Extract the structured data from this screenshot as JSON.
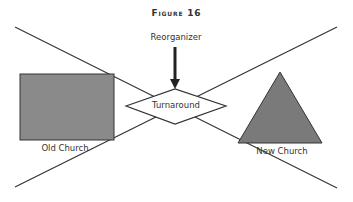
{
  "figure": {
    "title": "Figure 16"
  },
  "labels": {
    "reorganizer": "Reorganizer",
    "turnaround": "Turnaround",
    "old_church": "Old Church",
    "new_church": "New Church"
  },
  "colors": {
    "shape_fill": "#8a8a8a",
    "stroke": "#333333",
    "background": "#ffffff"
  },
  "geometry": {
    "line_a": {
      "x1": 15,
      "y1": 27,
      "x2": 337,
      "y2": 188
    },
    "line_b": {
      "x1": 15,
      "y1": 187,
      "x2": 337,
      "y2": 27
    },
    "rect": {
      "x": 20,
      "y": 74,
      "w": 94,
      "h": 66
    },
    "triangle": "280,72 238,143 322,143",
    "diamond": "126,106 175,89 226,106 175,124",
    "arrow": {
      "x": 175,
      "y1": 47,
      "y2": 89
    }
  }
}
